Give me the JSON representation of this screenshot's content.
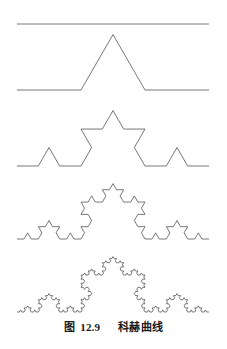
{
  "figure": {
    "caption_label": "图",
    "caption_number": "12.9",
    "caption_title": "科赫曲线",
    "caption_full": "图 12.9  科赫曲线",
    "line_color": "#555555",
    "background_color": "#ffffff",
    "text_color": "#1a1a1a"
  },
  "chart_data": {
    "type": "line",
    "title": "图 12.9  科赫曲线",
    "xlabel": "",
    "ylabel": "",
    "grid": false,
    "legend": null,
    "xlim": [
      0,
      227
    ],
    "ylim": [
      0,
      349
    ],
    "curve_type": "koch",
    "segment_start_x": 17,
    "segment_end_x": 209,
    "segment_length": 192,
    "series": [
      {
        "name": "order-0",
        "order": 0,
        "baseline_y": 24,
        "apex_y": 24,
        "segments": 1
      },
      {
        "name": "order-1",
        "order": 1,
        "baseline_y": 90,
        "apex_y": 34,
        "segments": 4
      },
      {
        "name": "order-2",
        "order": 2,
        "baseline_y": 166,
        "apex_y": 110,
        "segments": 16
      },
      {
        "name": "order-3",
        "order": 3,
        "baseline_y": 239,
        "apex_y": 183,
        "segments": 64
      },
      {
        "name": "order-4",
        "order": 4,
        "baseline_y": 312,
        "apex_y": 256,
        "segments": 256
      }
    ]
  }
}
